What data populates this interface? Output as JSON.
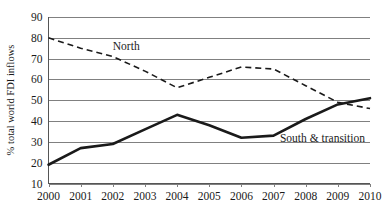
{
  "chart_data": {
    "type": "line",
    "title": "",
    "subtitle": "",
    "xlabel": "",
    "ylabel": "% total world FDI inflows",
    "x": [
      2000,
      2001,
      2002,
      2003,
      2004,
      2005,
      2006,
      2007,
      2008,
      2009,
      2010
    ],
    "xtick_labels": [
      "2000",
      "2001",
      "2002",
      "2003",
      "2004",
      "2005",
      "2006",
      "2007",
      "2008",
      "2009",
      "2010"
    ],
    "ytick_labels": [
      "10",
      "20",
      "30",
      "40",
      "50",
      "60",
      "70",
      "80",
      "90"
    ],
    "ytick_values": [
      10,
      20,
      30,
      40,
      50,
      60,
      70,
      80,
      90
    ],
    "ylim": [
      10,
      90
    ],
    "xlim": [
      2000,
      2010
    ],
    "grid": "horizontal",
    "legend_position": "inline-annotations",
    "series": [
      {
        "name": "North",
        "style": "dashed",
        "color": "#1a1a1a",
        "values": [
          80,
          75,
          71,
          64,
          56,
          61,
          66,
          65,
          57,
          49,
          46
        ]
      },
      {
        "name": "South & transition",
        "style": "solid",
        "color": "#1a1a1a",
        "values": [
          19,
          27,
          29,
          36,
          43,
          38,
          32,
          33,
          41,
          48,
          51
        ]
      }
    ],
    "annotations": [
      {
        "text": "North",
        "x": 2002,
        "y": 74
      },
      {
        "text": "South & transition",
        "x": 2007.2,
        "y": 30
      }
    ]
  }
}
